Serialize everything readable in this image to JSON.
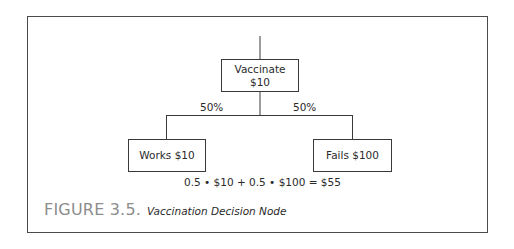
{
  "figure": {
    "label": "FIGURE 3.5.",
    "title": "Vaccination Decision Node"
  },
  "tree": {
    "root": {
      "line1": "Vaccinate",
      "line2": "$10"
    },
    "branches": [
      {
        "probability": "50%",
        "outcome": "Works $10"
      },
      {
        "probability": "50%",
        "outcome": "Fails $100"
      }
    ],
    "expected_value_formula": "0.5 • $10 + 0.5 • $100 = $55"
  }
}
